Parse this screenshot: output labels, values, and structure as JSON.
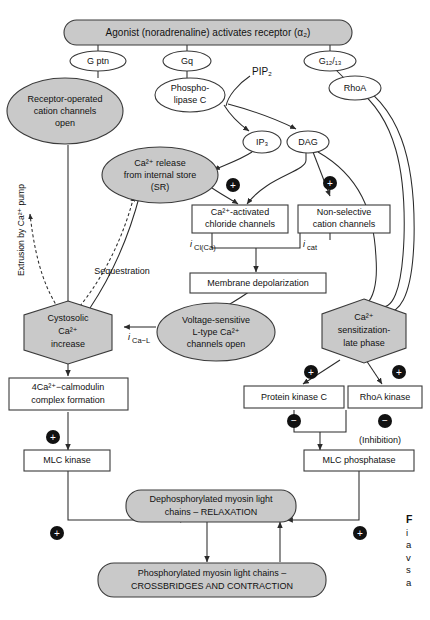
{
  "diagram": {
    "type": "signaling-pathway-flowchart",
    "title_node": "Agonist (noradrenaline) activates receptor (α₂)",
    "colors": {
      "node_fill": "#c9c9c9",
      "node_stroke": "#3a3a3a",
      "white_fill": "#ffffff",
      "line": "#2b2b2b",
      "badge": "#111111"
    },
    "nodes": {
      "agonist": "Agonist (noradrenaline) activates receptor (α₂)",
      "g_ptn": "G ptn",
      "gq": "Gq",
      "g1213": "G₁₂/₁₃",
      "rhoa": "RhoA",
      "plc_line1": "Phospho-",
      "plc_line2": "lipase C",
      "pip2": "PIP₂",
      "ip3": "IP₃",
      "dag": "DAG",
      "roc_line1": "Receptor-operated",
      "roc_line2": "cation channels",
      "roc_line3": "open",
      "ca_release_line1": "Ca²⁺ release",
      "ca_release_line2": "from internal store",
      "ca_release_line3": "(SR)",
      "cl_channels_line1": "Ca²⁺-activated",
      "cl_channels_line2": "chloride channels",
      "cat_channels_line1": "Non-selective",
      "cat_channels_line2": "cation channels",
      "depolarization": "Membrane depolarization",
      "vgcc_line1": "Voltage-sensitive",
      "vgcc_line2": "L-type Ca²⁺",
      "vgcc_line3": "channels open",
      "cytosolic_line1": "Cystosolic",
      "cytosolic_line2": "Ca²⁺",
      "cytosolic_line3": "increase",
      "sensitization_line1": "Ca²⁺",
      "sensitization_line2": "sensitization-",
      "sensitization_line3": "late phase",
      "calmodulin_line1": "4Ca²⁺−calmodulin",
      "calmodulin_line2": "complex formation",
      "pkc": "Protein kinase C",
      "rhoa_kinase": "RhoA kinase",
      "mlc_kinase": "MLC kinase",
      "mlc_phosphatase": "MLC phosphatase",
      "relaxation_line1": "Dephosphorylated myosin light",
      "relaxation_line2": "chains – RELAXATION",
      "contraction_line1": "Phosphorylated myosin light chains –",
      "contraction_line2": "CROSSBRIDGES AND CONTRACTION"
    },
    "edge_labels": {
      "extrusion": "Extrusion by Ca²⁺ pump",
      "sequestration": "Sequestration",
      "i_cl_ca_main": "i",
      "i_cl_ca_sub": "Cl(Ca)",
      "i_cat_main": "i",
      "i_cat_sub": "cat",
      "i_ca_l_main": "i",
      "i_ca_l_sub": "Ca−L",
      "inhibition": "(Inhibition)"
    },
    "badges": {
      "plus": "+",
      "minus": "−",
      "plus_count": 6,
      "minus_count": 2
    },
    "caption": {
      "marker": "F",
      "line2": "i",
      "line3": "a",
      "line4": "v",
      "line5": "s",
      "line6": "a"
    }
  }
}
